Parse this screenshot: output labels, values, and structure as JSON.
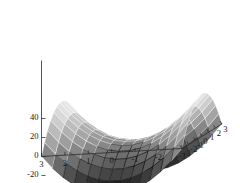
{
  "figure": {
    "title": "",
    "background": "#ffffff",
    "width": 240,
    "height": 183
  },
  "chart_data": {
    "type": "surface",
    "title": "",
    "xlabel": "",
    "ylabel": "",
    "zlabel": "",
    "surface_equation": "z = x^2 - y^2",
    "xlim": [
      -3,
      3
    ],
    "ylim": [
      -3,
      3
    ],
    "zlim": [
      -50,
      50
    ],
    "x_ticks": [
      3,
      2,
      1,
      0,
      -1,
      -2,
      -3
    ],
    "x_tick_labels": [
      "3",
      "2",
      "1",
      "0",
      "-1",
      "-2",
      "-3"
    ],
    "y_ticks": [
      -3,
      -2,
      -1,
      0,
      1,
      2,
      3
    ],
    "y_tick_labels": [
      "-3",
      "-2",
      "-1",
      "0",
      "1",
      "2",
      "3"
    ],
    "z_ticks": [
      40,
      20,
      0,
      -20,
      -40
    ],
    "z_tick_labels": [
      "40",
      "20",
      "0",
      "-20",
      "-40"
    ],
    "grid": true,
    "legend": "none",
    "mesh_divisions": 13,
    "colormap": "grayscale",
    "colormap_low": "#000000",
    "colormap_high": "#ffffff",
    "mesh_line_color_light": "#ffffff",
    "mesh_line_color_dark": "#000000",
    "axis_color": "#2b2b2b",
    "view_azimuth": 135,
    "view_elevation": 22,
    "corner_values": {
      "x_neg3_y_neg3": 0,
      "x_neg3_y_pos3": 0,
      "x_pos3_y_neg3": 0,
      "x_pos3_y_pos3": 0,
      "peak_left": 45,
      "peak_right": 45,
      "valley_front": -45,
      "valley_back": -45
    }
  },
  "axes": {
    "z_axis_name": "z-axis",
    "x_axis_name": "x-axis",
    "y_axis_name": "y-axis"
  }
}
